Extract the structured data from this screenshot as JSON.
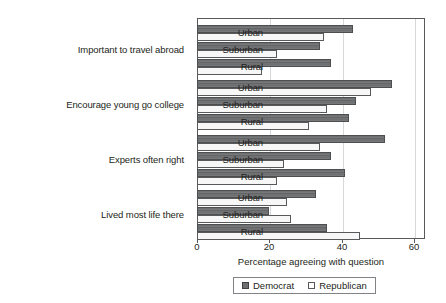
{
  "chart_data": {
    "type": "bar",
    "orientation": "horizontal",
    "title": "",
    "xlabel": "Percentage agreeing with question",
    "ylabel": "",
    "xlim": [
      0,
      63
    ],
    "xticks": [
      0,
      20,
      40,
      60
    ],
    "xtick_labels": [
      "0",
      "20",
      "40",
      "60"
    ],
    "grid": true,
    "grid_axis": "x",
    "legend_position": "bottom",
    "group_labels": [
      "Important to travel abroad",
      "Encourage young go college",
      "Experts often right",
      "Lived most life there"
    ],
    "categories": [
      "Urban",
      "Suburban",
      "Rural"
    ],
    "series": [
      {
        "name": "Democrat",
        "color": "#6e6f71",
        "groups": [
          {
            "group": "Important to travel abroad",
            "values": [
              43,
              34,
              37
            ]
          },
          {
            "group": "Encourage young go college",
            "values": [
              54,
              44,
              42
            ]
          },
          {
            "group": "Experts often right",
            "values": [
              52,
              37,
              41
            ]
          },
          {
            "group": "Lived most life there",
            "values": [
              33,
              20,
              36
            ]
          }
        ]
      },
      {
        "name": "Republican",
        "color": "#ffffff",
        "groups": [
          {
            "group": "Important to travel abroad",
            "values": [
              35,
              22,
              18
            ]
          },
          {
            "group": "Encourage young go college",
            "values": [
              48,
              36,
              31
            ]
          },
          {
            "group": "Experts often right",
            "values": [
              34,
              24,
              22
            ]
          },
          {
            "group": "Lived most life there",
            "values": [
              25,
              26,
              45
            ]
          }
        ]
      }
    ]
  },
  "legend": {
    "items": [
      {
        "label": "Democrat",
        "marker": "filled-square"
      },
      {
        "label": "Republican",
        "marker": "open-square"
      }
    ]
  }
}
